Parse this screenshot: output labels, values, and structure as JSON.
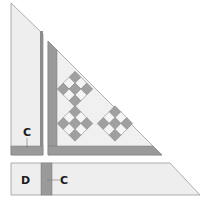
{
  "diagram": {
    "colors": {
      "background": "#ffffff",
      "light_fabric": "#eeeeee",
      "sashing": "#9a9a9a",
      "sashing_dark": "#7a7a7a",
      "cell_dark": "#a0a0a0",
      "cell_light": "#f4f4f4",
      "outline": "#8a8a8a"
    },
    "pieces": [
      {
        "id": "left-strip",
        "label": "C",
        "description": "Left border strip with bottom sashing band labeled C"
      },
      {
        "id": "setting-triangle",
        "label": "",
        "description": "Large triangle with left and bottom sashing and three 9-patch on-point blocks"
      },
      {
        "id": "bottom-strip",
        "labels": [
          "D",
          "C"
        ],
        "description": "Bottom border strip with section D, vertical sashing C"
      }
    ],
    "labels": {
      "left_c": "C",
      "bottom_d": "D",
      "bottom_c": "C"
    },
    "blocks": [
      {
        "name": "nine-patch-top",
        "center": [
          75,
          89
        ]
      },
      {
        "name": "nine-patch-bottom-left",
        "center": [
          75,
          123.5
        ]
      },
      {
        "name": "nine-patch-bottom-right",
        "center": [
          115,
          123.5
        ]
      }
    ]
  }
}
